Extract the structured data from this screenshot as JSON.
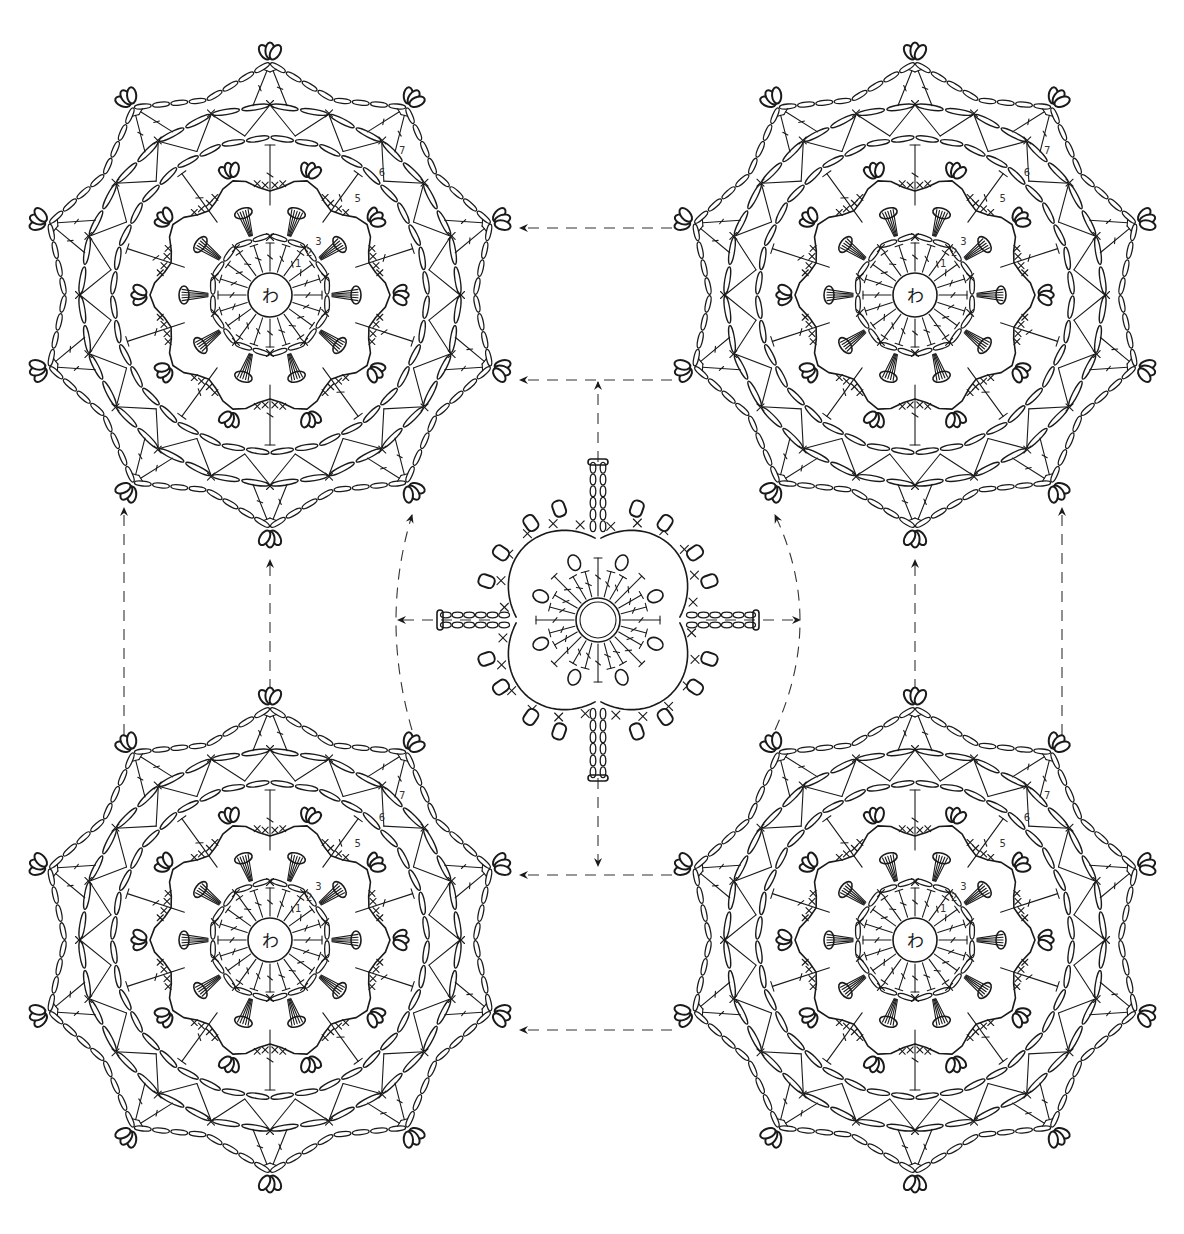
{
  "diagram": {
    "type": "crochet-chart",
    "colors": {
      "line": "#1a1a1a",
      "background": "#ffffff",
      "arrow": "#333333"
    },
    "large_motifs": [
      {
        "id": "motif-top-left",
        "cx": 270,
        "cy": 295,
        "center_label": "わ"
      },
      {
        "id": "motif-top-right",
        "cx": 915,
        "cy": 295,
        "center_label": "わ"
      },
      {
        "id": "motif-bottom-left",
        "cx": 270,
        "cy": 940,
        "center_label": "わ"
      },
      {
        "id": "motif-bottom-right",
        "cx": 915,
        "cy": 940,
        "center_label": "わ"
      }
    ],
    "large_motif_spec": {
      "points": 10,
      "center_ring_radius": 22,
      "outer_radius": 240,
      "round_labels": [
        "1",
        "2",
        "3",
        "5",
        "6",
        "7"
      ]
    },
    "joining_motif": {
      "id": "joining-motif",
      "cx": 598,
      "cy": 620,
      "arm_length": 160
    },
    "arrows": [
      {
        "from": [
          672,
          228
        ],
        "to": [
          520,
          228
        ]
      },
      {
        "from": [
          672,
          380
        ],
        "to": [
          520,
          380
        ]
      },
      {
        "from": [
          672,
          875
        ],
        "to": [
          520,
          875
        ]
      },
      {
        "from": [
          672,
          1030
        ],
        "to": [
          520,
          1030
        ]
      },
      {
        "from": [
          598,
          462
        ],
        "to": [
          598,
          382
        ]
      },
      {
        "from": [
          598,
          778
        ],
        "to": [
          598,
          866
        ]
      },
      {
        "from": [
          490,
          620
        ],
        "to": [
          398,
          620
        ]
      },
      {
        "from": [
          706,
          620
        ],
        "to": [
          800,
          620
        ]
      },
      {
        "from": [
          124,
          735
        ],
        "to": [
          124,
          508
        ]
      },
      {
        "from": [
          270,
          690
        ],
        "to": [
          270,
          560
        ]
      },
      {
        "from": [
          1062,
          735
        ],
        "to": [
          1062,
          508
        ]
      },
      {
        "from": [
          915,
          690
        ],
        "to": [
          915,
          560
        ]
      }
    ],
    "curved_guides": [
      {
        "side": "left",
        "top": [
          412,
          515
        ],
        "mid": [
          396,
          620
        ],
        "bottom": [
          412,
          730
        ]
      },
      {
        "side": "right",
        "top": [
          775,
          515
        ],
        "mid": [
          800,
          620
        ],
        "bottom": [
          775,
          730
        ]
      }
    ]
  }
}
